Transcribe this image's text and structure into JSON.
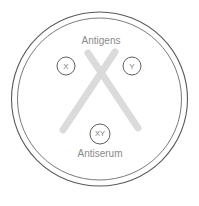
{
  "diagram": {
    "labels": {
      "antigens": "Antigens",
      "antiserum": "Antiserum"
    },
    "wells": [
      {
        "id": "well-x",
        "label": "X",
        "cx": 66,
        "cy": 66,
        "r": 9
      },
      {
        "id": "well-y",
        "label": "Y",
        "cx": 132,
        "cy": 66,
        "r": 9
      },
      {
        "id": "well-xy",
        "label": "XY",
        "cx": 100,
        "cy": 134,
        "r": 10
      }
    ],
    "dish": {
      "outer": {
        "cx": 99.5,
        "cy": 99,
        "rx": 88,
        "ry": 87
      },
      "inner": {
        "cx": 99.5,
        "cy": 99,
        "rx": 82,
        "ry": 81
      }
    },
    "precipitin_bands": [
      {
        "id": "band-left-to-right",
        "x1": 88,
        "y1": 53,
        "x2": 138,
        "y2": 128
      },
      {
        "id": "band-right-to-left",
        "x1": 115,
        "y1": 52,
        "x2": 63,
        "y2": 130
      }
    ],
    "text_positions": {
      "antigens": {
        "x": 101,
        "y": 41
      },
      "antiserum": {
        "x": 100,
        "y": 154
      }
    },
    "colors": {
      "dish_stroke": "#5a5a5a",
      "well_stroke": "#5f5f5f",
      "band": "#d9d9d9",
      "text": "#8a8a8a",
      "background": "#ffffff"
    }
  }
}
